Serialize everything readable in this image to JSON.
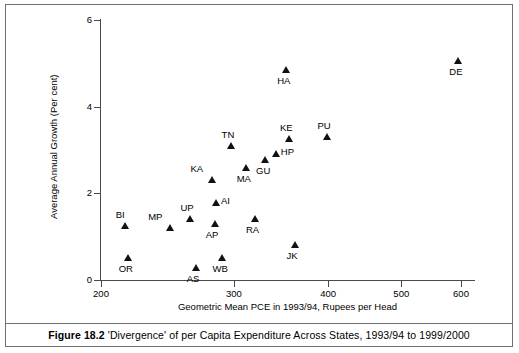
{
  "figure": {
    "number_label": "Figure 18.2",
    "caption": "'Divergence' of per Capita Expenditure Across States, 1993/94 to 1999/2000"
  },
  "axes": {
    "x_title": "Geometric Mean PCE in 1993/94, Rupees per Head",
    "y_title": "Average Annual Growth (Per cent)",
    "x_ticks": [
      "200",
      "300",
      "400",
      "500",
      "600"
    ],
    "y_ticks": [
      "0",
      "2",
      "4",
      "6"
    ]
  },
  "chart_data": {
    "type": "scatter",
    "title": "'Divergence' of per Capita Expenditure Across States, 1993/94 to 1999/2000",
    "xlabel": "Geometric Mean PCE in 1993/94, Rupees per Head",
    "ylabel": "Average Annual Growth (Per cent)",
    "xscale": "log",
    "yscale": "linear",
    "xlim": [
      190,
      650
    ],
    "ylim": [
      0,
      6
    ],
    "xticks": [
      200,
      300,
      400,
      500,
      600
    ],
    "yticks": [
      0,
      2,
      4,
      6
    ],
    "grid": false,
    "legend": "none",
    "marker": "filled-triangle",
    "marker_color": "#111111",
    "points": [
      {
        "label": "BI",
        "x": 215,
        "y": 1.25,
        "label_pos": "above"
      },
      {
        "label": "OR",
        "x": 217,
        "y": 0.52,
        "label_pos": "below"
      },
      {
        "label": "MP",
        "x": 247,
        "y": 1.2,
        "label_pos": "aboveleft"
      },
      {
        "label": "UP",
        "x": 262,
        "y": 1.42,
        "label_pos": "above"
      },
      {
        "label": "AS",
        "x": 267,
        "y": 0.28,
        "label_pos": "below"
      },
      {
        "label": "KA",
        "x": 281,
        "y": 2.3,
        "label_pos": "aboveleft"
      },
      {
        "label": "AI",
        "x": 284,
        "y": 1.78,
        "label_pos": "right"
      },
      {
        "label": "AP",
        "x": 283,
        "y": 1.3,
        "label_pos": "below"
      },
      {
        "label": "WB",
        "x": 289,
        "y": 0.52,
        "label_pos": "below"
      },
      {
        "label": "TN",
        "x": 297,
        "y": 3.1,
        "label_pos": "above"
      },
      {
        "label": "MA",
        "x": 311,
        "y": 2.58,
        "label_pos": "below"
      },
      {
        "label": "RA",
        "x": 320,
        "y": 1.4,
        "label_pos": "below"
      },
      {
        "label": "GU",
        "x": 330,
        "y": 2.78,
        "label_pos": "below"
      },
      {
        "label": "HP",
        "x": 341,
        "y": 2.9,
        "label_pos": "right"
      },
      {
        "label": "HA",
        "x": 352,
        "y": 4.85,
        "label_pos": "below"
      },
      {
        "label": "KE",
        "x": 355,
        "y": 3.25,
        "label_pos": "above"
      },
      {
        "label": "JK",
        "x": 362,
        "y": 0.8,
        "label_pos": "below"
      },
      {
        "label": "PU",
        "x": 398,
        "y": 3.3,
        "label_pos": "above"
      },
      {
        "label": "DE",
        "x": 595,
        "y": 5.05,
        "label_pos": "below"
      }
    ]
  }
}
